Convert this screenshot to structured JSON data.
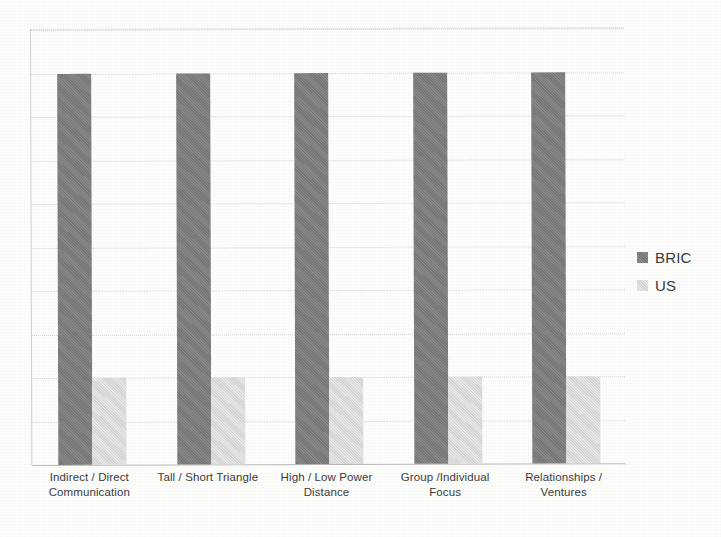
{
  "chart_data": {
    "type": "bar",
    "title": "",
    "subtitle": "",
    "xlabel": "",
    "ylabel": "",
    "ylim": [
      0,
      10
    ],
    "grid": true,
    "gridline_count": 10,
    "legend_position": "right",
    "orientation": "vertical",
    "categories": [
      "Indirect / Direct Communication",
      "Tall / Short Triangle",
      "High / Low Power Distance",
      "Group /Individual Focus",
      "Relationships / Ventures"
    ],
    "category_lines": [
      [
        "Indirect / Direct",
        "Communication"
      ],
      [
        "Tall / Short Triangle"
      ],
      [
        "High / Low Power",
        "Distance"
      ],
      [
        "Group /Individual",
        "Focus"
      ],
      [
        "Relationships /",
        "Ventures"
      ]
    ],
    "series": [
      {
        "name": "BRIC",
        "color": "#7b7b7b",
        "values": [
          9,
          9,
          9,
          9,
          9
        ]
      },
      {
        "name": "US",
        "color": "#d9dbdb",
        "values": [
          2,
          2,
          2,
          2,
          2
        ]
      }
    ],
    "axis_tick_labels": [],
    "annotations": []
  },
  "legend": {
    "items": [
      {
        "label": "BRIC",
        "swatch_class": "series-bric"
      },
      {
        "label": "US",
        "swatch_class": "series-us"
      }
    ]
  },
  "colors": {
    "background": "#fdfdfc",
    "bric": "#7b7b7b",
    "us": "#d9dbdb",
    "gridline": "#d2d2d2",
    "axis": "#b9b9b9",
    "text": "#3b3b3b"
  }
}
